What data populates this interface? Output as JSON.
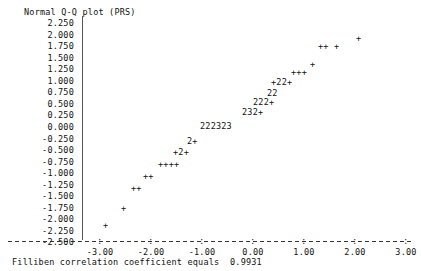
{
  "title": "Normal Q-Q plot (PRS)",
  "footer": "Filliben correlation coefficient equals  0.9931",
  "axes": {
    "y_ticks": [
      "2.250",
      "2.000",
      "1.750",
      "1.500",
      "1.250",
      "1.000",
      "0.750",
      "0.500",
      "0.250",
      "0.000",
      "-0.250",
      "-0.500",
      "-0.750",
      "-1.000",
      "-1.250",
      "-1.500",
      "-1.750",
      "-2.000",
      "-2.250",
      "-2.500"
    ],
    "x_ticks": [
      "-3.00",
      "-2.00",
      "-1.00",
      "0.00",
      "1.00",
      "2.00",
      "3.00"
    ],
    "x_label": "",
    "y_label": ""
  },
  "chart_data": {
    "type": "scatter",
    "title": "Normal Q-Q plot (PRS)",
    "xlabel": "",
    "ylabel": "",
    "xlim": [
      -3.5,
      3.5
    ],
    "ylim": [
      -2.5,
      2.25
    ],
    "grid": false,
    "legend": "none",
    "annotation": "Filliben correlation coefficient equals  0.9931",
    "filliben_r": 0.9931,
    "x_tick_values": [
      -3.0,
      -2.0,
      -1.0,
      0.0,
      1.0,
      2.0,
      3.0
    ],
    "y_tick_values": [
      2.25,
      2.0,
      1.75,
      1.5,
      1.25,
      1.0,
      0.75,
      0.5,
      0.25,
      0.0,
      -0.25,
      -0.5,
      -0.75,
      -1.0,
      -1.25,
      -1.5,
      -1.75,
      -2.0,
      -2.25,
      -2.5
    ],
    "marker_semantics": {
      "+": "one observation at this cell",
      "2": "two overlapping observations at this cell",
      "3": "three overlapping observations at this cell"
    },
    "rows": [
      {
        "y": 1.93,
        "px_left": 356,
        "glyphs": "+"
      },
      {
        "y": 1.75,
        "px_left": 318,
        "glyphs": "++ +"
      },
      {
        "y": 1.37,
        "px_left": 310,
        "glyphs": "+"
      },
      {
        "y": 1.2,
        "px_left": 291,
        "glyphs": "+++"
      },
      {
        "y": 0.98,
        "px_left": 271,
        "glyphs": "+22+"
      },
      {
        "y": 0.74,
        "px_left": 267,
        "glyphs": "22"
      },
      {
        "y": 0.54,
        "px_left": 253,
        "glyphs": "222+"
      },
      {
        "y": 0.32,
        "px_left": 242,
        "glyphs": "232+"
      },
      {
        "y": 0.03,
        "px_left": 200,
        "glyphs": "222323"
      },
      {
        "y": -0.3,
        "px_left": 187,
        "glyphs": "2+"
      },
      {
        "y": -0.55,
        "px_left": 173,
        "glyphs": "+2+"
      },
      {
        "y": -0.8,
        "px_left": 158,
        "glyphs": "++++"
      },
      {
        "y": -1.07,
        "px_left": 143,
        "glyphs": "++"
      },
      {
        "y": -1.32,
        "px_left": 131,
        "glyphs": "++"
      },
      {
        "y": -1.75,
        "px_left": 121,
        "glyphs": "+"
      },
      {
        "y": -2.13,
        "px_left": 103,
        "glyphs": "+"
      }
    ],
    "points_expanded": [
      {
        "x": -2.3,
        "y": -2.13,
        "n": 1
      },
      {
        "x": -1.95,
        "y": -1.75,
        "n": 1
      },
      {
        "x": -1.76,
        "y": -1.32,
        "n": 2
      },
      {
        "x": -1.54,
        "y": -1.07,
        "n": 2
      },
      {
        "x": -1.27,
        "y": -0.8,
        "n": 4
      },
      {
        "x": -1.0,
        "y": -0.55,
        "n": 3
      },
      {
        "x": -0.77,
        "y": -0.3,
        "n": 3
      },
      {
        "x": -0.52,
        "y": 0.03,
        "n": 14
      },
      {
        "x": 0.22,
        "y": 0.32,
        "n": 8
      },
      {
        "x": 0.42,
        "y": 0.54,
        "n": 7
      },
      {
        "x": 0.68,
        "y": 0.74,
        "n": 4
      },
      {
        "x": 0.78,
        "y": 0.98,
        "n": 6
      },
      {
        "x": 1.25,
        "y": 1.2,
        "n": 3
      },
      {
        "x": 1.58,
        "y": 1.37,
        "n": 1
      },
      {
        "x": 1.72,
        "y": 1.75,
        "n": 3
      },
      {
        "x": 2.4,
        "y": 1.93,
        "n": 1
      }
    ]
  }
}
